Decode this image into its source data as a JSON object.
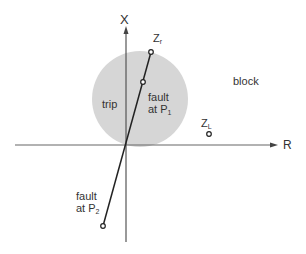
{
  "diagram": {
    "axes": {
      "x_label": "X",
      "r_label": "R"
    },
    "regions": {
      "trip": "trip",
      "block": "block"
    },
    "points": {
      "zr": {
        "main": "Z",
        "sub": "r"
      },
      "zl": {
        "main": "Z",
        "sub": "L"
      }
    },
    "faults": {
      "p1": {
        "line1": "fault",
        "line2": "at P",
        "sub": "1"
      },
      "p2": {
        "line1": "fault",
        "line2": "at P",
        "sub": "2"
      }
    },
    "colors": {
      "circle": "#d4d4d4",
      "line": "#222222"
    }
  }
}
